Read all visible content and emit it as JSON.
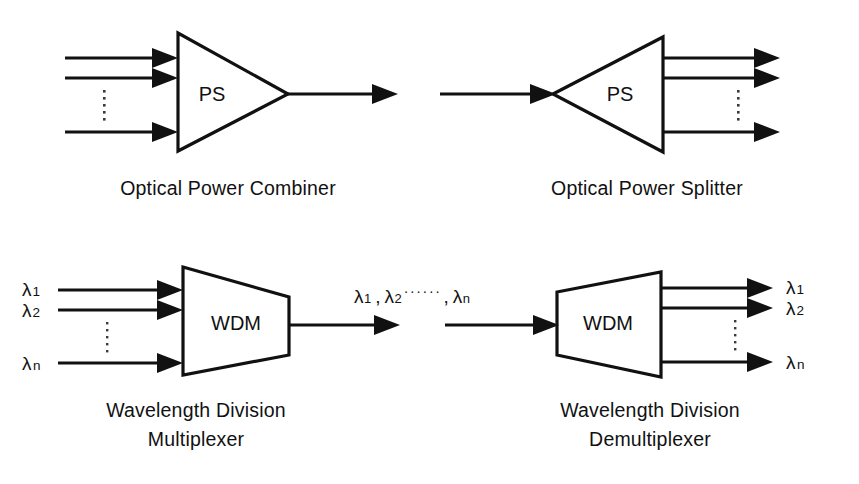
{
  "figure": {
    "background_color": "#ffffff",
    "line_color": "#111111"
  },
  "panels": {
    "combiner": {
      "device_label": "PS",
      "caption": "Optical  Power  Combiner",
      "shape": "triangle-right",
      "input_count_shown": 3,
      "vertical_ellipsis": "⋮",
      "output_count_shown": 1
    },
    "splitter": {
      "device_label": "PS",
      "caption": "Optical  Power  Splitter",
      "shape": "triangle-right",
      "input_count_shown": 1,
      "vertical_ellipsis": "⋮",
      "output_count_shown": 3
    },
    "mux": {
      "device_label": "WDM",
      "caption_line1": "Wavelength  Division",
      "caption_line2": "Multiplexer",
      "shape": "trapezoid-narrowing-right",
      "inputs": [
        {
          "symbol": "λ",
          "subscript": "1"
        },
        {
          "symbol": "λ",
          "subscript": "2"
        },
        {
          "symbol": "λ",
          "subscript": "n"
        }
      ],
      "vertical_ellipsis": "⋮"
    },
    "demux": {
      "device_label": "WDM",
      "caption_line1": "Wavelength  Division",
      "caption_line2": "Demultiplexer",
      "shape": "trapezoid-widening-right",
      "outputs": [
        {
          "symbol": "λ",
          "subscript": "1"
        },
        {
          "symbol": "λ",
          "subscript": "2"
        },
        {
          "symbol": "λ",
          "subscript": "n"
        }
      ],
      "vertical_ellipsis": "⋮"
    }
  },
  "trunk_label": {
    "lambda1": "λ",
    "sub1": "1",
    "comma1": ",",
    "lambda2": "λ",
    "sub2": "2",
    "dots": "······",
    "comma2": ",",
    "lambdan": "λ",
    "subn": "n",
    "full_text": "λ1 , λ2 ······ , λn"
  }
}
